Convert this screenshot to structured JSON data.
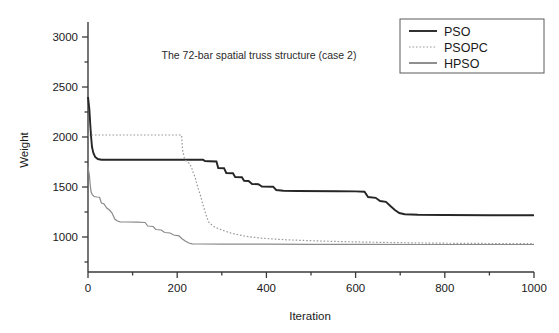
{
  "figure": {
    "title": "The 72-bar spatial truss structure (case 2)",
    "background": "#ffffff"
  },
  "axes": {
    "x": {
      "label": "Iteration",
      "ticks": [
        "0",
        "200",
        "400",
        "600",
        "800",
        "1000"
      ],
      "tick_values": [
        0,
        200,
        400,
        600,
        800,
        1000
      ],
      "minor_per_interval": 1,
      "min": 0,
      "max": 1000
    },
    "y": {
      "label": "Weight",
      "ticks": [
        "1000",
        "1500",
        "2000",
        "2500",
        "3000"
      ],
      "tick_values": [
        1000,
        1500,
        2000,
        2500,
        3000
      ],
      "min": 650,
      "max": 3200
    }
  },
  "legend": {
    "position": "top-right",
    "entries": [
      {
        "label": "PSO",
        "style": "solid",
        "color": "#262626"
      },
      {
        "label": "PSOPC",
        "style": "dotted",
        "color": "#9a9a9a"
      },
      {
        "label": "HPSO",
        "style": "solid",
        "color": "#8a8a8a"
      }
    ]
  },
  "chart_data": {
    "type": "line",
    "title": "The 72-bar spatial truss structure (case 2)",
    "xlabel": "Iteration",
    "ylabel": "Weight",
    "xlim": [
      0,
      1000
    ],
    "ylim": [
      650,
      3200
    ],
    "grid": false,
    "legend_position": "top-right",
    "series": [
      {
        "name": "PSO",
        "style": "solid",
        "color": "#262626",
        "points": [
          [
            0,
            2400
          ],
          [
            3,
            2280
          ],
          [
            5,
            2130
          ],
          [
            7,
            2000
          ],
          [
            9,
            1900
          ],
          [
            12,
            1840
          ],
          [
            16,
            1800
          ],
          [
            22,
            1780
          ],
          [
            30,
            1772
          ],
          [
            210,
            1772
          ],
          [
            258,
            1772
          ],
          [
            262,
            1760
          ],
          [
            272,
            1758
          ],
          [
            288,
            1755
          ],
          [
            292,
            1690
          ],
          [
            305,
            1688
          ],
          [
            310,
            1640
          ],
          [
            325,
            1638
          ],
          [
            330,
            1600
          ],
          [
            345,
            1598
          ],
          [
            350,
            1562
          ],
          [
            360,
            1560
          ],
          [
            368,
            1530
          ],
          [
            382,
            1528
          ],
          [
            390,
            1505
          ],
          [
            415,
            1503
          ],
          [
            422,
            1470
          ],
          [
            438,
            1462
          ],
          [
            470,
            1460
          ],
          [
            560,
            1458
          ],
          [
            600,
            1456
          ],
          [
            620,
            1452
          ],
          [
            628,
            1400
          ],
          [
            645,
            1392
          ],
          [
            655,
            1360
          ],
          [
            668,
            1352
          ],
          [
            678,
            1310
          ],
          [
            688,
            1270
          ],
          [
            698,
            1240
          ],
          [
            710,
            1228
          ],
          [
            740,
            1222
          ],
          [
            800,
            1220
          ],
          [
            900,
            1218
          ],
          [
            1000,
            1218
          ]
        ]
      },
      {
        "name": "PSOPC",
        "style": "dotted",
        "color": "#9a9a9a",
        "points": [
          [
            0,
            2020
          ],
          [
            40,
            2020
          ],
          [
            100,
            2020
          ],
          [
            160,
            2020
          ],
          [
            205,
            2020
          ],
          [
            210,
            2018
          ],
          [
            212,
            1870
          ],
          [
            216,
            1790
          ],
          [
            220,
            1760
          ],
          [
            226,
            1740
          ],
          [
            232,
            1700
          ],
          [
            236,
            1640
          ],
          [
            240,
            1600
          ],
          [
            244,
            1530
          ],
          [
            248,
            1470
          ],
          [
            252,
            1420
          ],
          [
            256,
            1350
          ],
          [
            260,
            1290
          ],
          [
            264,
            1230
          ],
          [
            268,
            1180
          ],
          [
            272,
            1140
          ],
          [
            278,
            1120
          ],
          [
            284,
            1100
          ],
          [
            292,
            1085
          ],
          [
            300,
            1070
          ],
          [
            310,
            1055
          ],
          [
            320,
            1040
          ],
          [
            335,
            1025
          ],
          [
            350,
            1010
          ],
          [
            370,
            998
          ],
          [
            390,
            988
          ],
          [
            415,
            980
          ],
          [
            445,
            972
          ],
          [
            480,
            966
          ],
          [
            520,
            960
          ],
          [
            560,
            955
          ],
          [
            610,
            950
          ],
          [
            660,
            946
          ],
          [
            720,
            942
          ],
          [
            790,
            938
          ],
          [
            860,
            936
          ],
          [
            930,
            934
          ],
          [
            1000,
            933
          ]
        ]
      },
      {
        "name": "HPSO",
        "style": "solid",
        "color": "#8a8a8a",
        "points": [
          [
            0,
            1700
          ],
          [
            3,
            1620
          ],
          [
            5,
            1520
          ],
          [
            7,
            1450
          ],
          [
            10,
            1420
          ],
          [
            14,
            1405
          ],
          [
            20,
            1400
          ],
          [
            26,
            1398
          ],
          [
            30,
            1340
          ],
          [
            36,
            1330
          ],
          [
            42,
            1290
          ],
          [
            48,
            1270
          ],
          [
            54,
            1240
          ],
          [
            60,
            1180
          ],
          [
            66,
            1160
          ],
          [
            72,
            1152
          ],
          [
            85,
            1150
          ],
          [
            110,
            1148
          ],
          [
            128,
            1145
          ],
          [
            134,
            1110
          ],
          [
            146,
            1105
          ],
          [
            152,
            1075
          ],
          [
            164,
            1070
          ],
          [
            172,
            1045
          ],
          [
            184,
            1040
          ],
          [
            192,
            1020
          ],
          [
            204,
            1012
          ],
          [
            210,
            985
          ],
          [
            218,
            960
          ],
          [
            226,
            940
          ],
          [
            234,
            932
          ],
          [
            250,
            930
          ],
          [
            300,
            929
          ],
          [
            400,
            928
          ],
          [
            500,
            927
          ],
          [
            620,
            926
          ],
          [
            750,
            925
          ],
          [
            870,
            925
          ],
          [
            1000,
            925
          ]
        ]
      }
    ]
  }
}
